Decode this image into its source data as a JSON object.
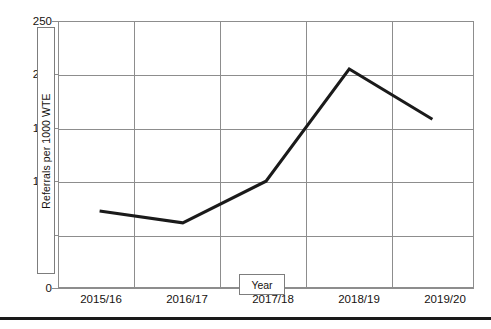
{
  "chart_data": {
    "type": "line",
    "title": "",
    "xlabel": "Year",
    "ylabel": "Referrals per 1000 WTE",
    "categories": [
      "2015/16",
      "2016/17",
      "2017/18",
      "2018/19",
      "2019/20"
    ],
    "values": [
      72,
      61,
      100,
      205,
      158
    ],
    "series": [
      {
        "name": "Referrals per 1000 WTE",
        "values": [
          72,
          61,
          100,
          205,
          158
        ],
        "color": "#1a1a1a",
        "line_width": 3,
        "markers": false
      }
    ],
    "ylim": [
      0,
      250
    ],
    "yticks": [
      0,
      50,
      100,
      150,
      200,
      250
    ],
    "ytick_labels": [
      "0",
      "50",
      "100",
      "150",
      "200",
      "250"
    ],
    "grid": {
      "horizontal": true,
      "vertical": true,
      "color": "#8d8d8d"
    },
    "legend": {
      "visible": false,
      "position": "none"
    },
    "annotations": []
  },
  "axes": {
    "y_title_label": "Referrals per 1000 WTE",
    "x_title_label": "Year"
  },
  "colors": {
    "line": "#1a1a1a",
    "grid": "#8d8d8d",
    "text": "#16120f",
    "background": "#ffffff",
    "rule": "#1a1a1a"
  }
}
